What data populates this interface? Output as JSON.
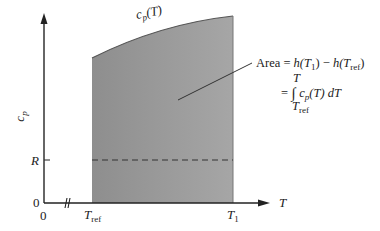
{
  "diagram": {
    "curve_label": {
      "main": "c",
      "sub": "p",
      "arg": "(T)"
    },
    "y_axis_label": {
      "main": "c",
      "sub": "p"
    },
    "x_axis_label": "T",
    "y_ticks": {
      "R": "R",
      "zero": "0"
    },
    "x_ticks": {
      "zero": "0",
      "t_ref_main": "T",
      "t_ref_sub": "ref",
      "t1_main": "T",
      "t1_sub": "1"
    },
    "annotation": {
      "line1_prefix": "Area = ",
      "line1_h1": "h",
      "line1_t1_paren_open": "(T",
      "line1_t1_sub": "1",
      "line1_t1_paren_close": ")",
      "line1_minus": " − ",
      "line1_h2": "h",
      "line1_tref_paren_open": "(T",
      "line1_tref_sub": "ref",
      "line1_tref_paren_close": ")",
      "upper_limit": "T",
      "equals": "= ",
      "integral": "∫",
      "integrand_c": "c",
      "integrand_sub": "p",
      "integrand_rest": "(T) dT",
      "lower_limit_main": "T",
      "lower_limit_sub": "ref"
    },
    "colors": {
      "shaded_fill": "#9a9a9a",
      "axis": "#222222",
      "dashed": "#333333",
      "background": "#ffffff"
    }
  }
}
